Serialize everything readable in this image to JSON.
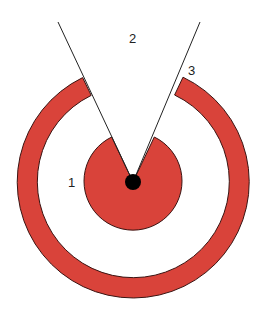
{
  "diagram": {
    "type": "concentric-target-with-sector-cutout",
    "colors": {
      "fill": "#d9433a",
      "stroke": "#3a1412",
      "line": "#222222",
      "center_dot": "#000000",
      "background": "#ffffff"
    },
    "labels": {
      "region_1": "1",
      "region_2": "2",
      "region_3": "3"
    }
  }
}
